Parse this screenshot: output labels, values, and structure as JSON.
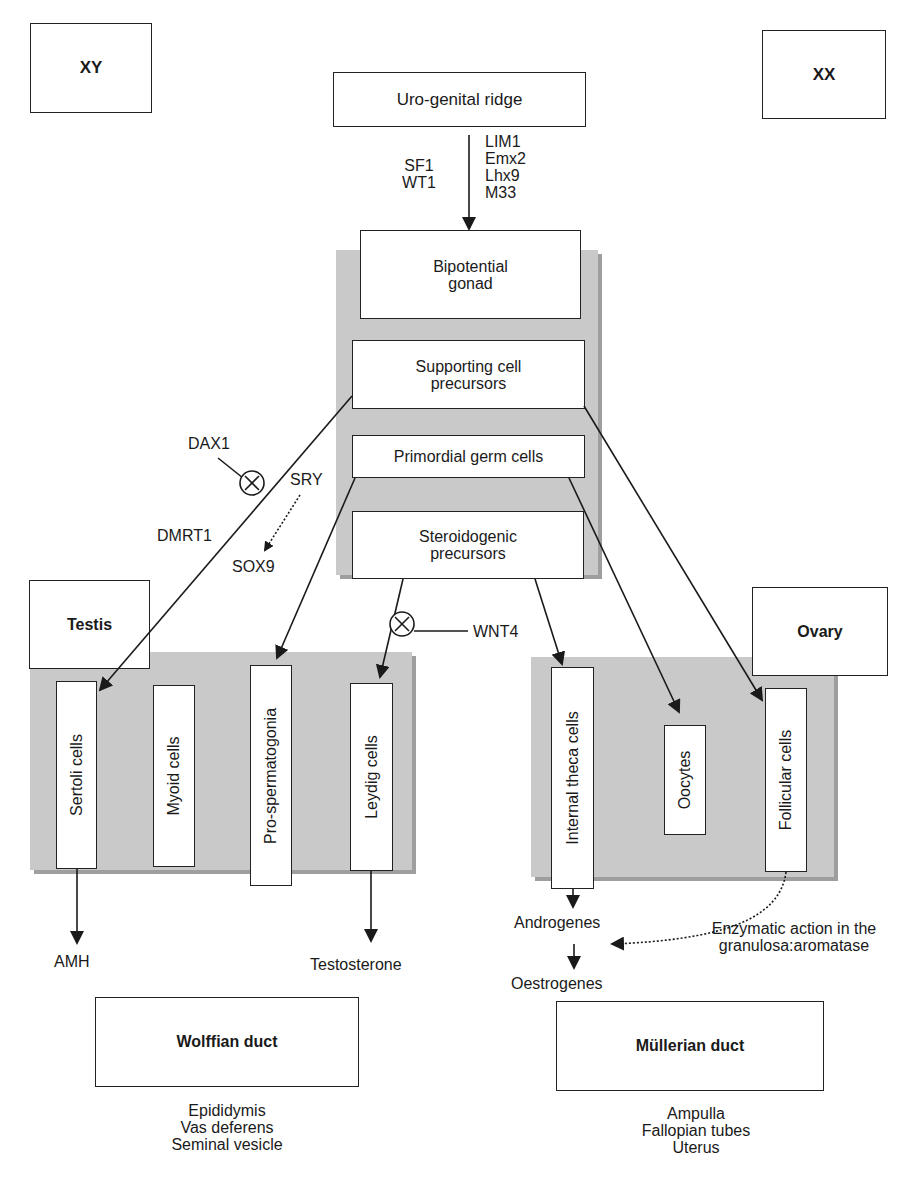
{
  "corners": {
    "xy": "XY",
    "xx": "XX"
  },
  "top": {
    "urogenital": "Uro-genital ridge",
    "factors_left": [
      "SF1",
      "WT1"
    ],
    "factors_right": [
      "LIM1",
      "Emx2",
      "Lhx9",
      "M33"
    ]
  },
  "gonad": {
    "bipotential": [
      "Bipotential",
      "gonad"
    ],
    "supporting": [
      "Supporting cell",
      "precursors"
    ],
    "germ": "Primordial germ cells",
    "steroidogenic": [
      "Steroidogenic",
      "precursors"
    ]
  },
  "regulators": {
    "dax1": "DAX1",
    "sry": "SRY",
    "dmrt1": "DMRT1",
    "sox9": "SOX9",
    "wnt4": "WNT4"
  },
  "testis": {
    "title": "Testis",
    "cells": [
      "Sertoli cells",
      "Myoid cells",
      "Pro-spermatogonia",
      "Leydig cells"
    ],
    "outputs": {
      "amh": "AMH",
      "testosterone": "Testosterone"
    }
  },
  "ovary": {
    "title": "Ovary",
    "cells": [
      "Internal theca cells",
      "Oocytes",
      "Follicular cells"
    ],
    "androgenes": "Androgenes",
    "oestrogenes": "Oestrogenes",
    "enzymatic": [
      "Enzymatic action in the",
      "granulosa:aromatase"
    ]
  },
  "ducts": {
    "wolffian": {
      "title": "Wolffian duct",
      "items": [
        "Epididymis",
        "Vas deferens",
        "Seminal vesicle"
      ]
    },
    "mullerian": {
      "title": "Müllerian duct",
      "items": [
        "Ampulla",
        "Fallopian tubes",
        "Uterus"
      ]
    }
  },
  "colors": {
    "shade": "#c9c9c9",
    "line": "#222222",
    "background": "#ffffff"
  }
}
